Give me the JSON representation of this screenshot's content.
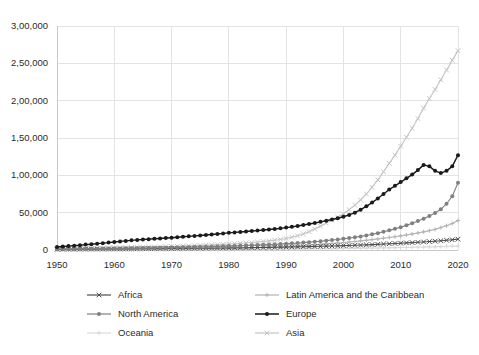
{
  "chart_data": {
    "type": "line",
    "title": "",
    "subtitle": "",
    "xlabel": "",
    "ylabel": "",
    "xlim": [
      1950,
      2020
    ],
    "ylim": [
      0,
      300000
    ],
    "grid": true,
    "legend_position": "bottom",
    "number_format": "indian",
    "x_tick_labels": [
      "1950",
      "1960",
      "1970",
      "1980",
      "1990",
      "2000",
      "2010",
      "2020"
    ],
    "x_ticks": [
      1950,
      1960,
      1970,
      1980,
      1990,
      2000,
      2010,
      2020
    ],
    "y_tick_labels": [
      "0",
      "50,000",
      "1,00,000",
      "1,50,000",
      "2,00,000",
      "2,50,000",
      "3,00,000"
    ],
    "y_ticks": [
      0,
      50000,
      100000,
      150000,
      200000,
      250000,
      300000
    ],
    "x": [
      1950,
      1951,
      1952,
      1953,
      1954,
      1955,
      1956,
      1957,
      1958,
      1959,
      1960,
      1961,
      1962,
      1963,
      1964,
      1965,
      1966,
      1967,
      1968,
      1969,
      1970,
      1971,
      1972,
      1973,
      1974,
      1975,
      1976,
      1977,
      1978,
      1979,
      1980,
      1981,
      1982,
      1983,
      1984,
      1985,
      1986,
      1987,
      1988,
      1989,
      1990,
      1991,
      1992,
      1993,
      1994,
      1995,
      1996,
      1997,
      1998,
      1999,
      2000,
      2001,
      2002,
      2003,
      2004,
      2005,
      2006,
      2007,
      2008,
      2009,
      2010,
      2011,
      2012,
      2013,
      2014,
      2015,
      2016,
      2017,
      2018,
      2019,
      2020
    ],
    "series": [
      {
        "name": "Africa",
        "color": "#4d4d4d",
        "marker": "x",
        "values": [
          900,
          950,
          1000,
          1050,
          1100,
          1150,
          1200,
          1250,
          1300,
          1350,
          1400,
          1450,
          1500,
          1560,
          1620,
          1680,
          1740,
          1800,
          1870,
          1940,
          2000,
          2070,
          2140,
          2220,
          2300,
          2380,
          2460,
          2550,
          2640,
          2730,
          2800,
          2900,
          3000,
          3100,
          3200,
          3300,
          3400,
          3520,
          3640,
          3760,
          3900,
          4050,
          4200,
          4380,
          4560,
          4750,
          4950,
          5150,
          5360,
          5580,
          5800,
          6050,
          6300,
          6600,
          6900,
          7250,
          7600,
          8000,
          8400,
          8750,
          9100,
          9500,
          9900,
          10300,
          10800,
          11300,
          11800,
          12400,
          13000,
          13700,
          14500
        ]
      },
      {
        "name": "Latin America and the Caribbean",
        "color": "#b3b3b3",
        "marker": "plus",
        "values": [
          500,
          530,
          560,
          590,
          620,
          660,
          700,
          740,
          780,
          820,
          870,
          910,
          960,
          1010,
          1060,
          1120,
          1180,
          1240,
          1300,
          1370,
          1440,
          1520,
          1600,
          1690,
          1780,
          1880,
          1980,
          2090,
          2200,
          2320,
          2450,
          2600,
          2750,
          2900,
          3100,
          3300,
          3500,
          3750,
          4000,
          4300,
          4600,
          5000,
          5400,
          5900,
          6400,
          7000,
          7600,
          8200,
          8800,
          9400,
          10000,
          10700,
          11400,
          12200,
          13000,
          13900,
          14800,
          15800,
          16800,
          17800,
          18900,
          20100,
          21400,
          22800,
          24300,
          25900,
          27600,
          30000,
          32500,
          35500,
          39500
        ]
      },
      {
        "name": "North America",
        "color": "#808080",
        "marker": "dot",
        "values": [
          1200,
          1280,
          1360,
          1440,
          1520,
          1620,
          1700,
          1790,
          1880,
          1970,
          2070,
          2170,
          2270,
          2380,
          2490,
          2600,
          2720,
          2840,
          2970,
          3100,
          3240,
          3400,
          3560,
          3730,
          3910,
          4100,
          4300,
          4510,
          4730,
          4960,
          5200,
          5460,
          5720,
          6000,
          6300,
          6610,
          6940,
          7290,
          7660,
          8050,
          8500,
          8900,
          9400,
          9900,
          10500,
          11100,
          11800,
          12500,
          13300,
          14100,
          15000,
          16000,
          17000,
          18200,
          19500,
          21000,
          22600,
          24400,
          26300,
          28300,
          30500,
          33000,
          35800,
          38800,
          42000,
          45500,
          49500,
          54500,
          62000,
          72000,
          90000
        ]
      },
      {
        "name": "Europe",
        "color": "#1a1a1a",
        "marker": "dot",
        "values": [
          4000,
          4600,
          5200,
          5800,
          6400,
          7200,
          7800,
          8500,
          9200,
          9900,
          10800,
          11500,
          12200,
          12900,
          13500,
          14000,
          14500,
          15000,
          15500,
          16000,
          16500,
          17100,
          17700,
          18300,
          18900,
          19500,
          20100,
          20800,
          21500,
          22200,
          23000,
          23600,
          24200,
          24800,
          25400,
          26000,
          26700,
          27400,
          28200,
          29000,
          30000,
          31000,
          32200,
          33500,
          34800,
          36200,
          37700,
          39200,
          40800,
          42500,
          44500,
          47000,
          50000,
          54000,
          58500,
          63500,
          69000,
          75000,
          81000,
          86000,
          91000,
          96000,
          101000,
          107000,
          114000,
          112000,
          106000,
          103000,
          106000,
          112000,
          127000
        ]
      },
      {
        "name": "Oceania",
        "color": "#d9d9d9",
        "marker": "plus",
        "values": [
          150,
          160,
          170,
          180,
          190,
          200,
          215,
          230,
          245,
          260,
          275,
          290,
          305,
          320,
          335,
          350,
          370,
          390,
          410,
          430,
          450,
          475,
          500,
          525,
          550,
          580,
          610,
          640,
          670,
          700,
          740,
          780,
          820,
          860,
          900,
          950,
          1000,
          1050,
          1100,
          1160,
          1220,
          1290,
          1360,
          1430,
          1500,
          1580,
          1660,
          1740,
          1820,
          1900,
          2000,
          2100,
          2200,
          2320,
          2440,
          2560,
          2700,
          2840,
          2980,
          3120,
          3280,
          3440,
          3600,
          3780,
          3960,
          4150,
          4350,
          4560,
          4780,
          5000,
          5250
        ]
      },
      {
        "name": "Asia",
        "color": "#c4c4c4",
        "marker": "x",
        "values": [
          1500,
          1620,
          1740,
          1860,
          1980,
          2120,
          2250,
          2390,
          2530,
          2680,
          2850,
          3000,
          3160,
          3330,
          3500,
          3690,
          3880,
          4080,
          4290,
          4500,
          4750,
          5000,
          5270,
          5550,
          5840,
          6150,
          6470,
          6810,
          7160,
          7530,
          7950,
          8400,
          8900,
          9450,
          10000,
          10700,
          11400,
          12200,
          13100,
          14100,
          15500,
          17000,
          19000,
          21500,
          24500,
          28000,
          32000,
          36000,
          40000,
          44000,
          48500,
          54000,
          60000,
          67000,
          75000,
          84000,
          94000,
          105000,
          116000,
          127000,
          139000,
          151000,
          163000,
          176000,
          190000,
          203000,
          215000,
          228000,
          241000,
          254000,
          267000
        ]
      }
    ]
  },
  "legend": {
    "items": [
      {
        "label": "Africa",
        "color": "#4d4d4d",
        "marker": "x"
      },
      {
        "label": "Latin America and the Caribbean",
        "color": "#b3b3b3",
        "marker": "plus"
      },
      {
        "label": "North America",
        "color": "#808080",
        "marker": "dot"
      },
      {
        "label": "Europe",
        "color": "#1a1a1a",
        "marker": "dot"
      },
      {
        "label": "Oceania",
        "color": "#d9d9d9",
        "marker": "plus"
      },
      {
        "label": "Asia",
        "color": "#c4c4c4",
        "marker": "x"
      }
    ]
  },
  "style": {
    "background": "#ffffff",
    "grid_color": "#e3e3e3",
    "axis_color": "#c9c9c9",
    "text_color": "#2b2b2b"
  }
}
